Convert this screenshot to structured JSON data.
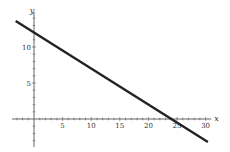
{
  "chart_data": {
    "type": "line",
    "title": "",
    "xlabel": "x",
    "ylabel": "y",
    "xlim": [
      -5,
      31
    ],
    "ylim": [
      -4,
      16
    ],
    "grid": false,
    "legend": null,
    "x_ticks": [
      5,
      10,
      15,
      20,
      25,
      30
    ],
    "y_ticks": [
      5,
      10
    ],
    "x_minor_step": 1,
    "y_minor_step": 1,
    "series": [
      {
        "name": "line",
        "equation": "y = 12 - 0.5x",
        "x": [
          -3.2,
          30.4
        ],
        "y": [
          13.6,
          -3.2
        ],
        "color": "#222222"
      }
    ],
    "annotations": []
  },
  "colors": {
    "axis": "#555555",
    "line": "#222222",
    "background": "#ffffff"
  }
}
